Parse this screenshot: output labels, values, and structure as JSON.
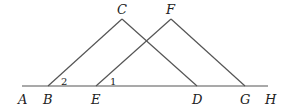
{
  "diagram": {
    "type": "geometry",
    "points": {
      "A": "A",
      "B": "B",
      "C": "C",
      "D": "D",
      "E": "E",
      "F": "F",
      "G": "G",
      "H": "H"
    },
    "angles": {
      "angle1": "1",
      "angle2": "2"
    },
    "segments": [
      "AH",
      "BC",
      "CD",
      "EF",
      "FG"
    ]
  }
}
